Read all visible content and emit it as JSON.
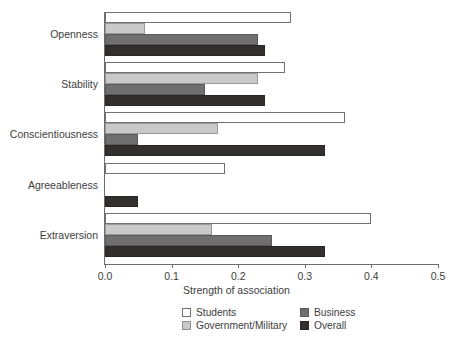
{
  "chart_data": {
    "type": "bar",
    "orientation": "horizontal",
    "title": "",
    "xlabel": "Strength of association",
    "ylabel": "",
    "xlim": [
      0.0,
      0.5
    ],
    "xticks": [
      "0.0",
      "0.1",
      "0.2",
      "0.3",
      "0.4",
      "0.5"
    ],
    "xtick_values": [
      0.0,
      0.1,
      0.2,
      0.3,
      0.4,
      0.5
    ],
    "grid": false,
    "legend_position": "below-axis",
    "categories": [
      "Openness",
      "Stability",
      "Conscientiousness",
      "Agreeableness",
      "Extraversion"
    ],
    "series": [
      {
        "name": "Students",
        "color": "#ffffff",
        "values": [
          0.28,
          0.27,
          0.36,
          0.18,
          0.4
        ]
      },
      {
        "name": "Government/Military",
        "color": "#c9c9c9",
        "values": [
          0.06,
          0.23,
          0.17,
          0.0,
          0.16
        ]
      },
      {
        "name": "Business",
        "color": "#6f6f6f",
        "values": [
          0.23,
          0.15,
          0.05,
          0.0,
          0.25
        ]
      },
      {
        "name": "Overall",
        "color": "#332f2f",
        "values": [
          0.24,
          0.24,
          0.33,
          0.05,
          0.33
        ]
      }
    ]
  },
  "axis": {
    "x_title": "Strength of association"
  },
  "legend": {
    "entries": [
      {
        "label": "Students",
        "swatch": "s-students"
      },
      {
        "label": "Business",
        "swatch": "s-business"
      },
      {
        "label": "Government/Military",
        "swatch": "s-gov"
      },
      {
        "label": "Overall",
        "swatch": "s-overall"
      }
    ]
  }
}
